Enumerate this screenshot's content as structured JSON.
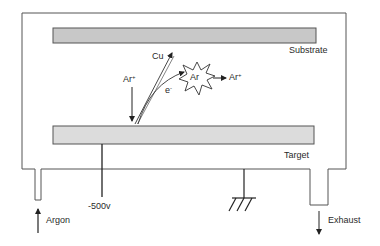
{
  "diagram": {
    "components": {
      "substrate": {
        "label": "Substrate",
        "color": "#c8c8c8"
      },
      "target": {
        "label": "Target",
        "color": "#d9d9d9"
      },
      "voltage": {
        "label": "-500v"
      },
      "gas_inlet": {
        "label": "Argon"
      },
      "exhaust": {
        "label": "Exhaust"
      },
      "ground": {
        "label": ""
      }
    },
    "species": {
      "ar_ion_incoming": {
        "base": "Ar",
        "charge": "+"
      },
      "copper": {
        "label": "Cu"
      },
      "electron": {
        "base": "e",
        "charge": "-"
      },
      "ar_neutral": {
        "label": "Ar"
      },
      "ar_ion_outgoing": {
        "base": "Ar",
        "charge": "+"
      }
    },
    "colors": {
      "line": "#333333",
      "background": "#ffffff"
    }
  }
}
